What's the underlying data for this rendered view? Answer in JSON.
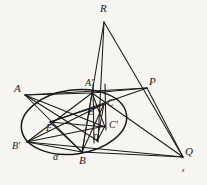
{
  "figure": {
    "background_color": "#f7f5f1",
    "ink_color": "#1b1a18",
    "canvas": {
      "width": 207,
      "height": 185
    }
  },
  "conic": {
    "name": "ellipse",
    "center_x": 74,
    "center_y": 122,
    "radius_x": 53,
    "radius_y": 32,
    "rotation_deg": -8
  },
  "points": [
    {
      "id": "R",
      "label": "R",
      "x": 104,
      "y": 20,
      "label_x": 100,
      "label_y": 3,
      "size": "lg"
    },
    {
      "id": "P",
      "label": "P",
      "x": 146,
      "y": 88,
      "label_x": 149,
      "label_y": 76,
      "size": "lg"
    },
    {
      "id": "Q",
      "label": "Q",
      "x": 182,
      "y": 156,
      "label_x": 185,
      "label_y": 146,
      "size": "lg"
    },
    {
      "id": "A",
      "label": "A",
      "x": 25,
      "y": 95,
      "label_x": 14,
      "label_y": 83,
      "size": "lg"
    },
    {
      "id": "Ap",
      "label": "A'",
      "x": 92,
      "y": 93,
      "label_x": 85,
      "label_y": 78,
      "size": "md"
    },
    {
      "id": "B",
      "label": "B",
      "x": 82,
      "y": 152,
      "label_x": 79,
      "label_y": 155,
      "size": "lg"
    },
    {
      "id": "Bp",
      "label": "B'",
      "x": 27,
      "y": 142,
      "label_x": 12,
      "label_y": 141,
      "size": "md"
    },
    {
      "id": "C",
      "label": "C",
      "x": 104,
      "y": 104,
      "label_x": 107,
      "label_y": 98,
      "size": "md"
    },
    {
      "id": "Cp",
      "label": "C'",
      "x": 104,
      "y": 126,
      "label_x": 109,
      "label_y": 120,
      "size": "md"
    },
    {
      "id": "D",
      "label": "D",
      "x": 97,
      "y": 140,
      "label_x": 93,
      "label_y": 134,
      "size": "sm"
    },
    {
      "id": "E",
      "label": "E",
      "x": 92,
      "y": 113,
      "label_x": 88,
      "label_y": 107,
      "size": "md"
    },
    {
      "id": "F",
      "label": "F",
      "x": 50,
      "y": 122,
      "label_x": 46,
      "label_y": 123,
      "size": "md"
    },
    {
      "id": "a",
      "label": "α",
      "x": 56,
      "y": 158,
      "label_x": 53,
      "label_y": 152,
      "size": "md"
    },
    {
      "id": "z",
      "label": "z",
      "x": 184,
      "y": 172,
      "label_x": 182,
      "label_y": 167,
      "size": "xs"
    }
  ],
  "segments": [
    {
      "name": "R-to-B",
      "x1": 104,
      "y1": 22,
      "x2": 82,
      "y2": 153
    },
    {
      "name": "R-to-D",
      "x1": 104,
      "y1": 22,
      "x2": 98,
      "y2": 142
    },
    {
      "name": "R-to-Q",
      "x1": 104,
      "y1": 22,
      "x2": 183,
      "y2": 157
    },
    {
      "name": "A-to-P",
      "x1": 25,
      "y1": 95,
      "x2": 147,
      "y2": 88
    },
    {
      "name": "A-to-Ap",
      "x1": 25,
      "y1": 95,
      "x2": 92,
      "y2": 93
    },
    {
      "name": "A-to-B",
      "x1": 25,
      "y1": 95,
      "x2": 82,
      "y2": 152
    },
    {
      "name": "A-to-Cp",
      "x1": 25,
      "y1": 95,
      "x2": 105,
      "y2": 127
    },
    {
      "name": "A-to-D",
      "x1": 25,
      "y1": 95,
      "x2": 98,
      "y2": 141
    },
    {
      "name": "Bp-to-Ap",
      "x1": 27,
      "y1": 142,
      "x2": 92,
      "y2": 93
    },
    {
      "name": "Bp-to-C",
      "x1": 27,
      "y1": 142,
      "x2": 104,
      "y2": 104
    },
    {
      "name": "Bp-to-Cp",
      "x1": 27,
      "y1": 142,
      "x2": 105,
      "y2": 126
    },
    {
      "name": "Bp-to-B",
      "x1": 27,
      "y1": 142,
      "x2": 82,
      "y2": 152
    },
    {
      "name": "Bp-to-Q",
      "x1": 27,
      "y1": 142,
      "x2": 183,
      "y2": 157
    },
    {
      "name": "B-to-Ap",
      "x1": 82,
      "y1": 152,
      "x2": 92,
      "y2": 93
    },
    {
      "name": "B-to-C",
      "x1": 82,
      "y1": 152,
      "x2": 104,
      "y2": 104
    },
    {
      "name": "B-to-Q",
      "x1": 82,
      "y1": 152,
      "x2": 183,
      "y2": 157
    },
    {
      "name": "Ap-to-Cp",
      "x1": 92,
      "y1": 93,
      "x2": 105,
      "y2": 127
    },
    {
      "name": "Ap-to-P",
      "x1": 92,
      "y1": 93,
      "x2": 147,
      "y2": 88
    },
    {
      "name": "Ap-to-Q",
      "x1": 92,
      "y1": 93,
      "x2": 183,
      "y2": 157
    },
    {
      "name": "P-to-Q",
      "x1": 147,
      "y1": 88,
      "x2": 183,
      "y2": 157
    },
    {
      "name": "P-to-F",
      "x1": 147,
      "y1": 88,
      "x2": 50,
      "y2": 122
    },
    {
      "name": "Cp-to-D",
      "x1": 105,
      "y1": 126,
      "x2": 97,
      "y2": 141
    },
    {
      "name": "C-to-D",
      "x1": 104,
      "y1": 104,
      "x2": 97,
      "y2": 141
    },
    {
      "name": "vert-left",
      "x1": 93,
      "y1": 84,
      "x2": 94,
      "y2": 143
    },
    {
      "name": "vert-right",
      "x1": 105,
      "y1": 84,
      "x2": 106,
      "y2": 130
    },
    {
      "name": "F-to-C",
      "x1": 50,
      "y1": 122,
      "x2": 105,
      "y2": 104
    },
    {
      "name": "F-to-B",
      "x1": 50,
      "y1": 122,
      "x2": 82,
      "y2": 152
    },
    {
      "name": "F-to-Cp",
      "x1": 50,
      "y1": 122,
      "x2": 105,
      "y2": 127
    }
  ]
}
